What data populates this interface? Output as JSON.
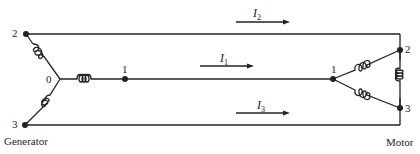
{
  "generator": {
    "label": "Generator",
    "nodes": {
      "top": "2",
      "bottom": "3",
      "neutral": "0",
      "line": "1"
    }
  },
  "motor": {
    "label": "Motor",
    "nodes": {
      "top": "2",
      "bottom": "3",
      "center": "1"
    }
  },
  "currents": [
    {
      "symbol": "I",
      "sub": "2"
    },
    {
      "symbol": "I",
      "sub": "1"
    },
    {
      "symbol": "I",
      "sub": "3"
    }
  ],
  "colors": {
    "line": "#222222",
    "background": "#ffffff"
  }
}
